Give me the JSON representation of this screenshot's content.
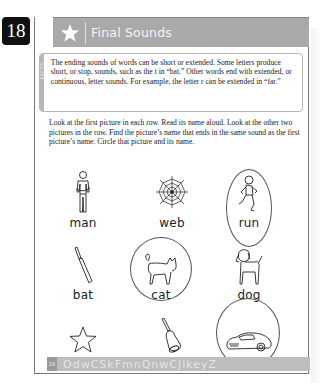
{
  "page": {
    "number": "18",
    "title": "Final Sounds",
    "facts_label": "FACTS",
    "facts_text": "The ending sounds of words can be short or extended. Some letters produce short, or stop, sounds, such as the t in “bat.” Other words end with extended, or continuous, letter sounds. For example, the letter r can be extended in “far.”",
    "instructions": "Look at the first picture in each row. Read its name aloud. Look at the other two pictures in the row. Find the picture’s name that ends in the same sound as the first picture’s name. Circle that picture and its name."
  },
  "rows": [
    {
      "items": [
        {
          "word": "man",
          "icon": "man-icon",
          "circled": false
        },
        {
          "word": "web",
          "icon": "spider-web-icon",
          "circled": false
        },
        {
          "word": "run",
          "icon": "running-boy-icon",
          "circled": true
        }
      ]
    },
    {
      "items": [
        {
          "word": "bat",
          "icon": "cricket-bat-icon",
          "circled": false
        },
        {
          "word": "cat",
          "icon": "cat-icon",
          "circled": true
        },
        {
          "word": "dog",
          "icon": "dog-icon",
          "circled": false
        }
      ]
    },
    {
      "items": [
        {
          "word": "star",
          "icon": "star-outline-icon",
          "circled": false
        },
        {
          "word": "bell",
          "icon": "bell-icon",
          "circled": false
        },
        {
          "word": "car",
          "icon": "car-icon",
          "circled": true
        }
      ]
    }
  ],
  "footer": {
    "page_number": "18",
    "decorative_letters": "OdwCSkFmnQnwCJikeyZ"
  },
  "colors": {
    "header_bg": "#a9a9a9",
    "badge_bg": "#111111",
    "footer_bg": "#bdbdbd",
    "frame_border": "#777777"
  }
}
